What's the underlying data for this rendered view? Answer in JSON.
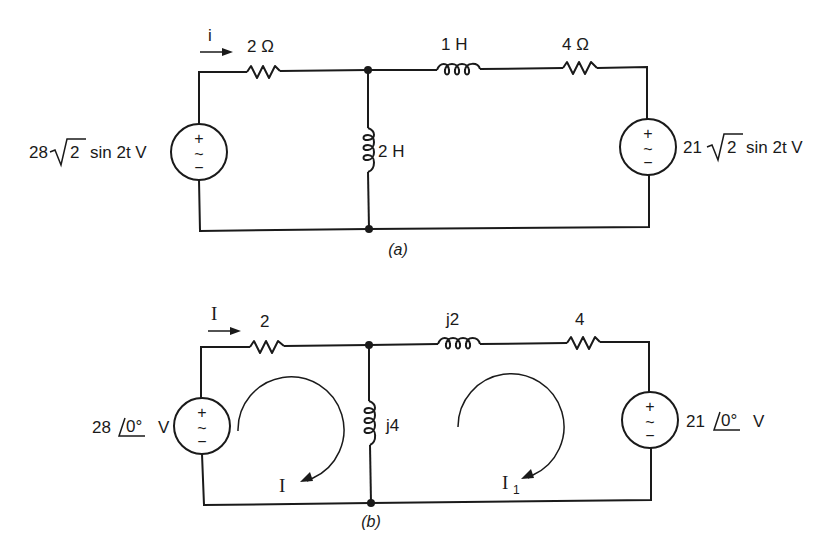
{
  "figure_a": {
    "caption": "(a)",
    "current_label": "i",
    "left_source": {
      "prefix": "28",
      "radical": "2",
      "suffix": "sin 2t V",
      "plus": "+",
      "tilde": "~",
      "minus": "−"
    },
    "right_source": {
      "prefix": "21",
      "radical": "2",
      "suffix": "sin 2t V",
      "plus": "+",
      "tilde": "~",
      "minus": "−"
    },
    "r1_label": "2 Ω",
    "shunt_inductor_label": "2 H",
    "series_inductor_label": "1 H",
    "r2_label": "4 Ω"
  },
  "figure_b": {
    "caption": "(b)",
    "current_label": "I",
    "left_source": {
      "magnitude": "28",
      "angle": "0°",
      "unit": "V",
      "plus": "+",
      "tilde": "~",
      "minus": "−"
    },
    "right_source": {
      "magnitude": "21",
      "angle": "0°",
      "unit": "V",
      "plus": "+",
      "tilde": "~",
      "minus": "−"
    },
    "r1_label": "2",
    "shunt_inductor_label": "j4",
    "series_inductor_label": "j2",
    "r2_label": "4",
    "mesh_left_label": "I",
    "mesh_right_label": "I",
    "mesh_right_subscript": "1"
  }
}
